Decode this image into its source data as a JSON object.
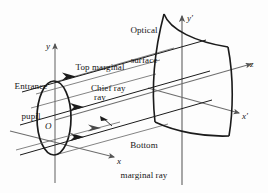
{
  "figure": {
    "background_color": "#fdfdfd",
    "line_color": "#1b1b1b",
    "axis_color": "#6d6d6d"
  },
  "labels": {
    "optical_surface_line1": "Optical",
    "optical_surface_line2": "surface",
    "entrance_pupil_line1": "Entrance",
    "entrance_pupil_line2": "pupil",
    "top_marginal_line1": "Top marginal",
    "top_marginal_line2": "ray",
    "chief_ray": "Chief ray",
    "bottom_marginal_line1": "Bottom",
    "bottom_marginal_line2": "marginal ray",
    "origin": "O"
  },
  "axes": {
    "y": "y",
    "x": "x",
    "z": "z",
    "y_prime": "y′",
    "x_prime": "x′"
  },
  "elements": {
    "entrance_pupil_name": "entrance-pupil-ellipse",
    "optical_surface_name": "optical-surface-patch",
    "rays": [
      "top-marginal-ray",
      "chief-ray",
      "bottom-marginal-ray"
    ]
  }
}
